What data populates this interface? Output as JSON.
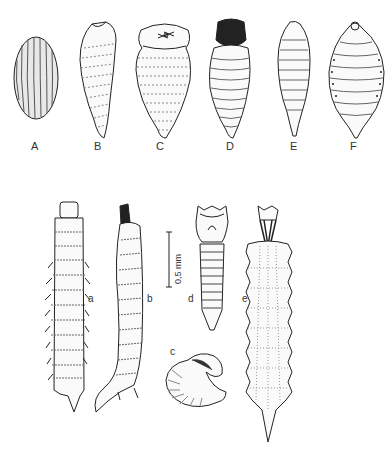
{
  "figure": {
    "panels_top": [
      {
        "id": "A",
        "label": "A",
        "description": "egg"
      },
      {
        "id": "B",
        "label": "B",
        "description": "larva, slender curved"
      },
      {
        "id": "C",
        "label": "C",
        "description": "larva with enlarged head segment"
      },
      {
        "id": "D",
        "label": "D",
        "description": "larva with dark sclerotized head"
      },
      {
        "id": "E",
        "label": "E",
        "description": "larva, fusiform segmented"
      },
      {
        "id": "F",
        "label": "F",
        "description": "larva, broad with spiracles"
      }
    ],
    "panels_bottom": [
      {
        "id": "a",
        "label": "a",
        "description": "larva with lateral processes"
      },
      {
        "id": "b",
        "label": "b",
        "description": "larva, lateral view with hooked tail"
      },
      {
        "id": "c",
        "label": "c",
        "description": "larva, curled"
      },
      {
        "id": "d",
        "label": "d",
        "description": "larva, tapered segmented"
      },
      {
        "id": "e",
        "label": "e",
        "description": "larva with dark mouth hooks and spiny margins"
      }
    ],
    "scale_bar": {
      "label": "0,5 mm"
    }
  }
}
